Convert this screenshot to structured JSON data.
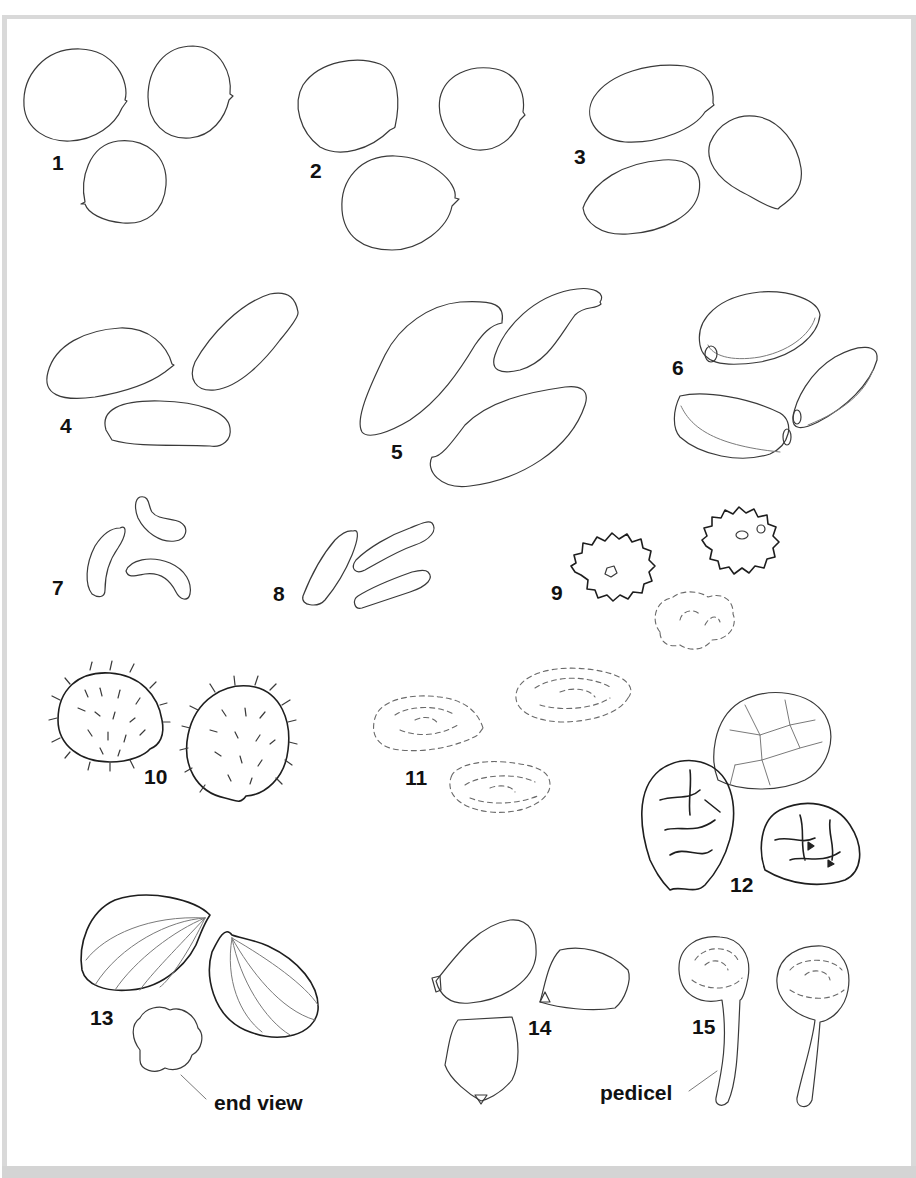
{
  "figure": {
    "background": "#ffffff",
    "frame_color": "#d9d9d9",
    "ink_color": "#3a3a3a",
    "label_color": "#111111"
  },
  "specimens": [
    {
      "number": "1",
      "shape": "round seeds with small apical point",
      "count": 3
    },
    {
      "number": "2",
      "shape": "round/ovate seeds with notched apex",
      "count": 3
    },
    {
      "number": "3",
      "shape": "oblong elliptic seeds",
      "count": 3
    },
    {
      "number": "4",
      "shape": "elongate oblong seeds",
      "count": 3
    },
    {
      "number": "5",
      "shape": "curved falcate seeds",
      "count": 3
    },
    {
      "number": "6",
      "shape": "ovoid seeds with rim and hilum",
      "count": 3
    },
    {
      "number": "7",
      "shape": "curved reniform seeds",
      "count": 3
    },
    {
      "number": "8",
      "shape": "slender cylindrical seeds",
      "count": 3
    },
    {
      "number": "9",
      "shape": "tuberculate clustered seeds",
      "count": 3
    },
    {
      "number": "10",
      "shape": "spiny round seeds",
      "count": 2
    },
    {
      "number": "11",
      "shape": "concentrically wrinkled seeds",
      "count": 3
    },
    {
      "number": "12",
      "shape": "reticulate spiny seeds",
      "count": 3
    },
    {
      "number": "13",
      "shape": "ribbed ovoid seeds",
      "count": 2
    },
    {
      "number": "14",
      "shape": "angular polygonal seeds",
      "count": 3
    },
    {
      "number": "15",
      "shape": "globose seeds on pedicel",
      "count": 2
    }
  ],
  "annotations": {
    "end_view": "end view",
    "pedicel": "pedicel"
  }
}
